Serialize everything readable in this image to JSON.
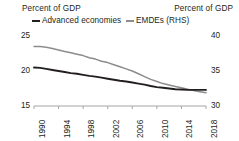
{
  "chart_data": {
    "type": "line",
    "title": "",
    "subtitle": "",
    "xlabel": "",
    "ylabel": "Percent of GDP",
    "ylabel_right": "Percent of GDP",
    "x": [
      1990,
      1991,
      1992,
      1993,
      1994,
      1995,
      1996,
      1997,
      1998,
      1999,
      2000,
      2001,
      2002,
      2003,
      2004,
      2005,
      2006,
      2007,
      2008,
      2009,
      2010,
      2011,
      2012,
      2013,
      2014,
      2015,
      2016,
      2017,
      2018
    ],
    "xtick_labels": [
      "1990",
      "1994",
      "1998",
      "2002",
      "2006",
      "2010",
      "2014",
      "2018"
    ],
    "xticks": [
      1990,
      1994,
      1998,
      2002,
      2006,
      2010,
      2014,
      2018
    ],
    "xlim": [
      1990,
      2018
    ],
    "ylim": [
      15,
      25
    ],
    "ytick_labels": [
      "15",
      "20",
      "25"
    ],
    "yticks": [
      15,
      20,
      25
    ],
    "ylim_right": [
      30,
      40
    ],
    "ytick_labels_right": [
      "30",
      "35",
      "40"
    ],
    "yticks_right": [
      30,
      35,
      40
    ],
    "grid": false,
    "legend_position": "top",
    "series": [
      {
        "name": "Advanced economies",
        "axis": "left",
        "color": "#231f20",
        "values": [
          20.5,
          20.45,
          20.3,
          20.15,
          20.0,
          19.85,
          19.7,
          19.6,
          19.45,
          19.3,
          19.2,
          19.05,
          18.9,
          18.75,
          18.6,
          18.5,
          18.35,
          18.2,
          18.05,
          17.85,
          17.7,
          17.6,
          17.5,
          17.4,
          17.35,
          17.3,
          17.3,
          17.3,
          17.3
        ]
      },
      {
        "name": "EMDEs (RHS)",
        "axis": "right",
        "color": "#8c8c8c",
        "values": [
          38.5,
          38.5,
          38.4,
          38.2,
          38.0,
          37.8,
          37.6,
          37.4,
          37.2,
          36.9,
          36.7,
          36.4,
          36.2,
          35.9,
          35.6,
          35.3,
          35.0,
          34.6,
          34.2,
          33.8,
          33.5,
          33.2,
          33.0,
          32.8,
          32.6,
          32.4,
          32.2,
          32.05,
          31.9
        ]
      }
    ]
  },
  "axis_titles": {
    "left": "Percent of GDP",
    "right": "Percent of GDP"
  },
  "colors": {
    "series_advanced": "#231f20",
    "series_emde": "#8c8c8c",
    "axis": "#a6a6a6",
    "text": "#231f20",
    "background": "#ffffff"
  }
}
